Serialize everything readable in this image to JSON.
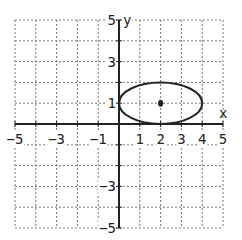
{
  "chart_data": {
    "type": "line",
    "title": "",
    "xlabel": "x",
    "ylabel": "y",
    "xlim": [
      -5,
      5
    ],
    "ylim": [
      -5,
      5
    ],
    "grid": true,
    "grid_style": "dotted",
    "x_tick_labels": [
      "-5",
      "-3",
      "-1",
      "1",
      "2",
      "3",
      "4",
      "5"
    ],
    "x_ticks": [
      -5,
      -3,
      -1,
      1,
      2,
      3,
      4,
      5
    ],
    "y_tick_labels": [
      "5",
      "3",
      "1",
      "-3",
      "-5"
    ],
    "y_ticks": [
      5,
      3,
      1,
      -3,
      -5
    ],
    "series": [
      {
        "name": "ellipse",
        "shape": "ellipse",
        "center": [
          2,
          1
        ],
        "rx": 2,
        "ry": 1,
        "equation": "(x-2)^2/4 + (y-1)^2 = 1"
      },
      {
        "name": "center-point",
        "shape": "point",
        "x": 2,
        "y": 1
      }
    ]
  },
  "colors": {
    "axis": "#222222",
    "grid": "#777777",
    "curve": "#222222"
  }
}
